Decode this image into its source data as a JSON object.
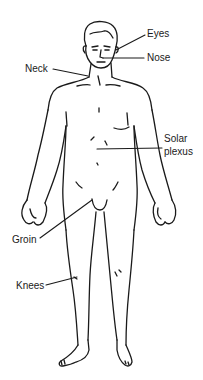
{
  "diagram": {
    "line_color": "#1a1a1a",
    "background": "#ffffff",
    "labels": [
      {
        "id": "eyes",
        "text": "Eyes",
        "x": 147,
        "y": 28
      },
      {
        "id": "nose",
        "text": "Nose",
        "x": 147,
        "y": 52
      },
      {
        "id": "neck",
        "text": "Neck",
        "x": 25,
        "y": 63
      },
      {
        "id": "solar-plexus-line1",
        "text": "Solar",
        "x": 164,
        "y": 133
      },
      {
        "id": "solar-plexus-line2",
        "text": "plexus",
        "x": 164,
        "y": 147
      },
      {
        "id": "groin",
        "text": "Groin",
        "x": 12,
        "y": 234
      },
      {
        "id": "knees",
        "text": "Knees",
        "x": 16,
        "y": 280
      }
    ]
  }
}
